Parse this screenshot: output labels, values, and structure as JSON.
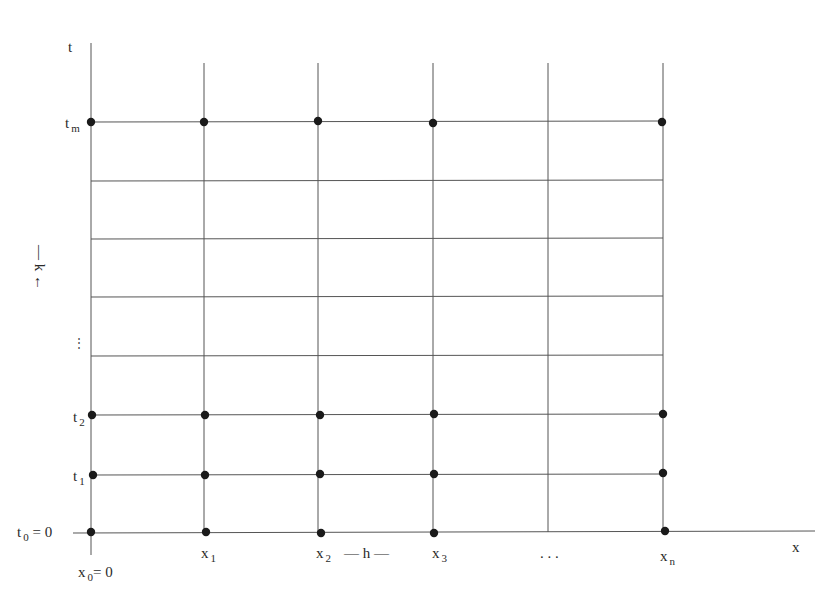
{
  "diagram": {
    "type": "finite-difference-grid",
    "axes": {
      "t_axis_label": "t",
      "x_axis_label": "x"
    },
    "t_labels": {
      "t0": {
        "main": "t",
        "sub": "0",
        "suffix": " = 0"
      },
      "t1": {
        "main": "t",
        "sub": "1"
      },
      "t2": {
        "main": "t",
        "sub": "2"
      },
      "tm": {
        "main": "t",
        "sub": "m"
      },
      "vdots": "⋮"
    },
    "x_labels": {
      "x0": {
        "main": "x",
        "sub": "0",
        "suffix": "= 0"
      },
      "x1": {
        "main": "x",
        "sub": "1"
      },
      "x2": {
        "main": "x",
        "sub": "2"
      },
      "x3": {
        "main": "x",
        "sub": "3"
      },
      "xn": {
        "main": "x",
        "sub": "n"
      },
      "hdots": ". . ."
    },
    "spacing": {
      "h_label": "— h —",
      "k_label": "— k ←"
    },
    "grid": {
      "x_positions": [
        91,
        204,
        318,
        433,
        548,
        663
      ],
      "y_positions": [
        123,
        181,
        239,
        297,
        356,
        415,
        474,
        532
      ],
      "dot_rows": [
        "t_m",
        "t_2",
        "t_1",
        "t_0"
      ],
      "dot_columns": [
        "x_0",
        "x_1",
        "x_2",
        "x_3",
        "x_n"
      ]
    },
    "colors": {
      "line": "#555555",
      "dot": "#1a1a1a",
      "background": "#ffffff"
    }
  }
}
